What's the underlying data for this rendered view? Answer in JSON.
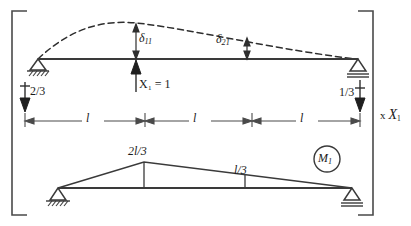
{
  "figure": {
    "type": "structural-engineering-diagram",
    "line_color": "#3a3a3a",
    "text_color": "#1a1a1a",
    "background": "#ffffff"
  },
  "upper_diagram": {
    "name": "deflected-beam-with-unit-load",
    "beam_label": "beam",
    "deflection_curve_label": "deflected-shape",
    "unit_load_label": "X₁ = 1",
    "unit_load_value": 1,
    "deflections": [
      {
        "symbol": "δ₁₁",
        "base": "δ",
        "sub": "11",
        "at_span_fraction": 0.3333
      },
      {
        "symbol": "δ₂₁",
        "base": "δ",
        "sub": "21",
        "at_span_fraction": 0.6667
      }
    ],
    "reactions": [
      {
        "name": "left-reaction",
        "label": "2/3",
        "direction": "down"
      },
      {
        "name": "right-reaction",
        "label": "1/3",
        "direction": "down"
      }
    ],
    "supports": [
      {
        "name": "left-support",
        "type": "pin-hatched"
      },
      {
        "name": "right-support",
        "type": "roller-double-line"
      }
    ],
    "dimensions": [
      {
        "label": "l",
        "span": 1
      },
      {
        "label": "l",
        "span": 2
      },
      {
        "label": "l",
        "span": 3
      }
    ]
  },
  "lower_diagram": {
    "name": "bending-moment-diagram",
    "diagram_tag": "M₁",
    "diagram_tag_base": "M",
    "diagram_tag_sub": "1",
    "ordinates": [
      {
        "label": "2l/3",
        "numerator": "2l",
        "denominator": "3",
        "at_span_fraction": 0.3333
      },
      {
        "label": "l/3",
        "numerator": "l",
        "denominator": "3",
        "at_span_fraction": 0.6667
      }
    ],
    "supports": [
      {
        "name": "left-support",
        "type": "pin-hatched"
      },
      {
        "name": "right-support",
        "type": "roller-double-line"
      }
    ]
  },
  "bracket": {
    "name": "grouping-bracket",
    "multiplier_label": "x X₁",
    "multiplier_prefix": "x",
    "multiplier_base": "X",
    "multiplier_sub": "1"
  }
}
